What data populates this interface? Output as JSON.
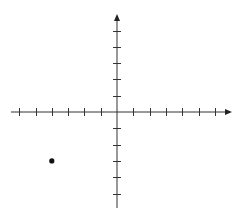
{
  "diagram": {
    "type": "coordinate-plane",
    "origin_px": {
      "x": 117,
      "y": 112
    },
    "unit_px": 16.3,
    "x_axis": {
      "min_px": 11,
      "max_px": 232,
      "ticks_negative": 6,
      "ticks_positive": 6,
      "arrow": "right"
    },
    "y_axis": {
      "min_px": 14,
      "max_px": 208,
      "ticks_positive": 5,
      "ticks_negative": 5,
      "arrow": "up"
    },
    "points": [
      {
        "label": "point",
        "x": -4,
        "y": -3
      }
    ],
    "colors": {
      "axis": "#333333",
      "point": "#111111",
      "background": "#ffffff"
    }
  }
}
